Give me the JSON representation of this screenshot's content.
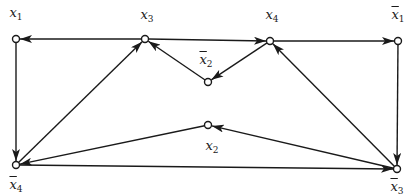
{
  "diagram": {
    "type": "directed-graph",
    "stroke_color": "#1a1a1a",
    "node_fill": "#ffffff",
    "nodes": [
      {
        "id": "x1",
        "base": "x",
        "sub": "1",
        "negated": false,
        "x": 16,
        "y": 39,
        "label_x": 16,
        "label_y": 6
      },
      {
        "id": "x3",
        "base": "x",
        "sub": "3",
        "negated": false,
        "x": 145,
        "y": 39,
        "label_x": 147,
        "label_y": 8
      },
      {
        "id": "x4",
        "base": "x",
        "sub": "4",
        "negated": false,
        "x": 270,
        "y": 41,
        "label_x": 272,
        "label_y": 8
      },
      {
        "id": "nx1",
        "base": "x",
        "sub": "1",
        "negated": true,
        "x": 398,
        "y": 41,
        "label_x": 398,
        "label_y": 8
      },
      {
        "id": "nx2",
        "base": "x",
        "sub": "2",
        "negated": true,
        "x": 208,
        "y": 82,
        "label_x": 206,
        "label_y": 53
      },
      {
        "id": "x2",
        "base": "x",
        "sub": "2",
        "negated": false,
        "x": 208,
        "y": 125,
        "label_x": 212,
        "label_y": 139
      },
      {
        "id": "nx4",
        "base": "x",
        "sub": "4",
        "negated": true,
        "x": 16,
        "y": 165,
        "label_x": 16,
        "label_y": 178
      },
      {
        "id": "nx3",
        "base": "x",
        "sub": "3",
        "negated": true,
        "x": 397,
        "y": 169,
        "label_x": 397,
        "label_y": 180
      }
    ],
    "edges": [
      {
        "from": "x3",
        "to": "x1"
      },
      {
        "from": "x3",
        "to": "x4"
      },
      {
        "from": "x4",
        "to": "nx1"
      },
      {
        "from": "nx2",
        "to": "x3"
      },
      {
        "from": "x4",
        "to": "nx2"
      },
      {
        "from": "x1",
        "to": "nx4"
      },
      {
        "from": "nx1",
        "to": "nx3"
      },
      {
        "from": "nx4",
        "to": "x3"
      },
      {
        "from": "nx3",
        "to": "x4"
      },
      {
        "from": "x2",
        "to": "nx4"
      },
      {
        "from": "nx3",
        "to": "x2"
      },
      {
        "from": "nx4",
        "to": "nx3"
      }
    ]
  }
}
